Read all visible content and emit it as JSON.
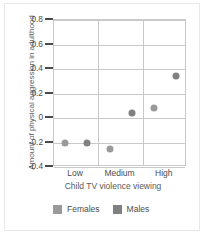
{
  "chart_data": {
    "type": "scatter",
    "title": "",
    "xlabel": "Child TV violence viewing",
    "ylabel": "Amount of physical aggression in adulthood",
    "categories": [
      "Low",
      "Medium",
      "High"
    ],
    "ylim": [
      -0.4,
      0.8
    ],
    "ytick_labels": [
      "0.8",
      "0.6",
      "0.4",
      "0.2",
      "0",
      "-0.2",
      "-0.4"
    ],
    "ytick_values": [
      0.8,
      0.6,
      0.4,
      0.2,
      0,
      -0.2,
      -0.4
    ],
    "grid": "horizontal-and-vertical",
    "legend_position": "bottom",
    "series": [
      {
        "name": "Females",
        "color": "#9a9a9a",
        "values": [
          -0.2,
          -0.25,
          0.08
        ]
      },
      {
        "name": "Males",
        "color": "#808080",
        "values": [
          -0.2,
          0.04,
          0.34
        ]
      }
    ]
  },
  "legend": {
    "entries": [
      {
        "label": "Females",
        "swatch_color": "#9a9a9a"
      },
      {
        "label": "Males",
        "swatch_color": "#808080"
      }
    ]
  },
  "colors": {
    "grid": "#c9c9c9",
    "axis_text": "#4d4d4d",
    "frame": "#e8e8e6",
    "background": "#ffffff"
  }
}
